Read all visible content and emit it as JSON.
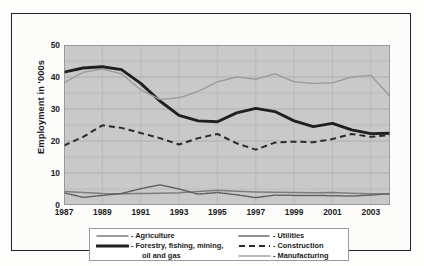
{
  "chart_data": {
    "type": "line",
    "title": "",
    "xlabel": "",
    "ylabel": "Employment in '000s",
    "xlim": [
      1987,
      2004
    ],
    "ylim": [
      0,
      50
    ],
    "yticks": [
      0,
      10,
      20,
      30,
      40,
      50
    ],
    "xticks": [
      1987,
      1989,
      1991,
      1993,
      1995,
      1997,
      1999,
      2001,
      2003
    ],
    "x": [
      1987,
      1988,
      1989,
      1990,
      1991,
      1992,
      1993,
      1994,
      1995,
      1996,
      1997,
      1998,
      1999,
      2000,
      2001,
      2002,
      2003,
      2004
    ],
    "grid": true,
    "legend_position": "bottom",
    "plot_background": "#c9c9c9",
    "series": [
      {
        "name": "Agriculture",
        "style": "solid-thin",
        "color": "#7d7d7d",
        "values": [
          4.2,
          3.9,
          3.6,
          3.5,
          3.6,
          3.7,
          3.8,
          4.2,
          4.6,
          4.3,
          4.1,
          4.0,
          3.9,
          3.8,
          3.9,
          3.7,
          3.5,
          3.4
        ]
      },
      {
        "name": "Forestry, fishing, mining, oil and gas",
        "style": "solid-thick",
        "color": "#1f1f1f",
        "values": [
          41.5,
          42.8,
          43.2,
          42.3,
          38.0,
          32.5,
          28.0,
          26.3,
          26.0,
          28.8,
          30.2,
          29.2,
          26.3,
          24.5,
          25.5,
          23.5,
          22.3,
          22.4
        ]
      },
      {
        "name": "Utilities",
        "style": "dotted-fine",
        "color": "#5e5e5e",
        "values": [
          3.8,
          2.4,
          3.0,
          3.6,
          5.1,
          6.3,
          5.0,
          3.4,
          3.9,
          3.2,
          2.3,
          3.1,
          3.0,
          3.0,
          2.9,
          2.8,
          3.1,
          3.6
        ]
      },
      {
        "name": "Construction",
        "style": "dashed",
        "color": "#2a2a2a",
        "values": [
          18.6,
          21.3,
          24.9,
          24.1,
          22.5,
          20.9,
          18.9,
          20.9,
          22.2,
          19.3,
          17.3,
          19.5,
          19.8,
          19.6,
          20.6,
          22.2,
          21.3,
          21.9
        ]
      },
      {
        "name": "Manufacturing",
        "style": "dotted-light",
        "color": "#9b9b9b",
        "values": [
          38.2,
          41.5,
          42.5,
          41.0,
          36.0,
          33.0,
          33.5,
          35.5,
          38.5,
          40.0,
          39.3,
          41.0,
          38.5,
          38.0,
          38.2,
          40.0,
          40.5,
          34.0
        ]
      }
    ]
  },
  "axis": {
    "y_title": "Employment in '000s",
    "y_tick_labels": [
      "50",
      "40",
      "30",
      "20",
      "10",
      "0"
    ],
    "x_tick_labels": [
      "1987",
      "1989",
      "1991",
      "1993",
      "1995",
      "1997",
      "1999",
      "2001",
      "2003"
    ]
  },
  "legend": {
    "left_items": [
      {
        "label": "- Agriculture",
        "label2": "",
        "sample": "solid-thin-line-icon"
      },
      {
        "label": "- Forestry, fishing, mining,",
        "label2": "oil and gas",
        "sample": "solid-thick-line-icon"
      }
    ],
    "right_items": [
      {
        "label": "- Utilities",
        "sample": "dotted-fine-line-icon"
      },
      {
        "label": "- Construction",
        "sample": "dashed-line-icon"
      },
      {
        "label": "- Manufacturing",
        "sample": "dotted-light-line-icon"
      }
    ]
  }
}
